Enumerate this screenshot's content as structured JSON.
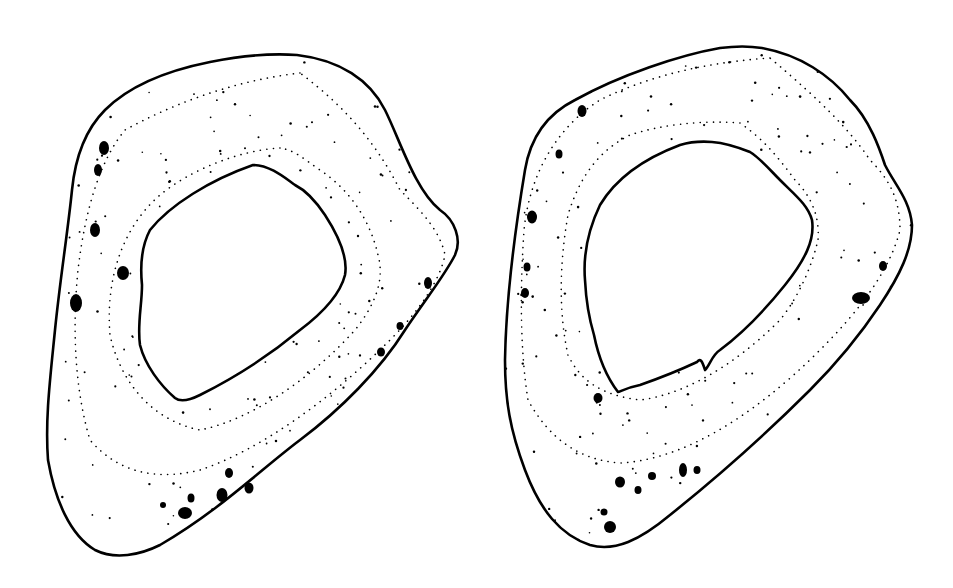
{
  "figure": {
    "background": "#ffffff",
    "ink_color": "#000000",
    "sections": [
      {
        "id": "left",
        "label": "bone-cross-section-left",
        "outer_path": "M297,55 C340,60 370,80 385,110 C400,140 415,190 440,210 C455,220 462,240 455,255 C445,275 425,300 405,330 C380,370 340,410 300,440 C260,470 220,510 160,545 C140,555 115,560 95,550 C70,535 55,500 48,460 C45,420 50,380 55,330 C60,280 68,230 72,190 C75,160 85,130 105,110 C130,85 170,70 210,62 C240,56 270,53 297,55 Z",
        "inner_path": "M253,165 C270,165 285,178 295,185 C305,190 315,200 325,215 C338,235 348,258 345,275 C340,295 320,315 300,330 C270,355 240,375 200,395 C190,400 180,402 175,398 C160,385 145,365 140,345 C137,325 142,305 142,285 C140,265 142,245 150,230 C170,205 210,180 253,165 Z",
        "ring_paths": [
          "M300,73 C240,80 180,100 125,130 C100,160 85,210 78,270 C72,330 75,390 90,440 C120,475 160,480 200,470 C260,450 330,400 390,340 C420,310 440,280 445,255 C440,230 420,210 400,190 C380,150 350,110 300,73 Z",
          "M280,148 C240,150 190,170 160,195 C125,225 105,275 110,335 C120,380 150,420 200,430 C250,420 310,380 355,330 C375,305 385,280 378,255 C370,220 350,190 320,170 C305,160 295,150 280,148 Z"
        ],
        "spots": [
          {
            "cx": 104,
            "cy": 148,
            "rx": 5,
            "ry": 7
          },
          {
            "cx": 98,
            "cy": 170,
            "rx": 4,
            "ry": 6
          },
          {
            "cx": 95,
            "cy": 230,
            "rx": 5,
            "ry": 7
          },
          {
            "cx": 123,
            "cy": 273,
            "rx": 6,
            "ry": 7
          },
          {
            "cx": 76,
            "cy": 303,
            "rx": 6,
            "ry": 9
          },
          {
            "cx": 428,
            "cy": 283,
            "rx": 4,
            "ry": 6
          },
          {
            "cx": 400,
            "cy": 326,
            "rx": 3.5,
            "ry": 4
          },
          {
            "cx": 381,
            "cy": 352,
            "rx": 4,
            "ry": 4.5
          },
          {
            "cx": 229,
            "cy": 473,
            "rx": 4,
            "ry": 5
          },
          {
            "cx": 249,
            "cy": 488,
            "rx": 4.5,
            "ry": 5.5
          },
          {
            "cx": 222,
            "cy": 495,
            "rx": 5.5,
            "ry": 7
          },
          {
            "cx": 191,
            "cy": 498,
            "rx": 3.5,
            "ry": 4.5
          },
          {
            "cx": 163,
            "cy": 505,
            "rx": 3,
            "ry": 3
          },
          {
            "cx": 185,
            "cy": 513,
            "rx": 7,
            "ry": 6
          }
        ]
      },
      {
        "id": "right",
        "label": "bone-cross-section-right",
        "outer_path": "M762,48 C800,55 830,75 850,100 C870,120 880,150 885,165 C895,185 910,200 912,225 C912,250 900,275 880,305 C860,335 840,360 810,390 C770,430 720,475 670,515 C640,540 615,552 590,545 C560,535 540,510 525,470 C510,430 505,400 505,360 C506,300 515,230 525,170 C530,140 545,115 575,100 C620,75 680,55 720,48 C735,46 750,46 762,48 Z",
        "inner_path": "M712,142 C725,143 740,148 750,152 C760,158 770,170 780,180 C795,195 808,205 812,220 C815,240 805,260 785,285 C765,310 740,335 720,350 C712,355 710,365 705,370 C702,360 700,358 697,362 C680,370 660,378 640,385 C625,388 620,392 618,392 C605,375 598,355 594,335 C588,315 586,300 585,280 C583,255 588,230 600,205 C615,180 640,160 680,145 C690,142 700,141 712,142 Z",
        "ring_paths": [
          "M770,58 C710,62 650,75 600,100 C560,125 530,170 524,230 C520,290 520,350 528,400 C550,440 580,460 620,463 C680,460 750,420 820,350 C860,310 890,270 900,230 C900,200 890,180 870,160 C850,130 820,100 770,58 Z",
          "M740,123 C700,120 660,125 630,135 C600,150 580,175 568,215 C560,260 558,310 568,355 C580,380 600,395 640,400 C680,395 730,370 780,320 C800,295 812,265 818,240 C820,215 810,195 795,180 C780,160 765,140 740,123 Z"
        ],
        "spots": [
          {
            "cx": 582,
            "cy": 111,
            "rx": 4.5,
            "ry": 6
          },
          {
            "cx": 559,
            "cy": 154,
            "rx": 3.5,
            "ry": 4.5
          },
          {
            "cx": 532,
            "cy": 217,
            "rx": 5,
            "ry": 6.5
          },
          {
            "cx": 527,
            "cy": 267,
            "rx": 3.5,
            "ry": 4.5
          },
          {
            "cx": 525,
            "cy": 293,
            "rx": 4,
            "ry": 5
          },
          {
            "cx": 883,
            "cy": 266,
            "rx": 4,
            "ry": 5
          },
          {
            "cx": 861,
            "cy": 298,
            "rx": 9,
            "ry": 6
          },
          {
            "cx": 598,
            "cy": 398,
            "rx": 4.5,
            "ry": 5
          },
          {
            "cx": 683,
            "cy": 470,
            "rx": 4,
            "ry": 7
          },
          {
            "cx": 697,
            "cy": 470,
            "rx": 3.5,
            "ry": 4
          },
          {
            "cx": 652,
            "cy": 476,
            "rx": 4,
            "ry": 4
          },
          {
            "cx": 620,
            "cy": 482,
            "rx": 5,
            "ry": 5.5
          },
          {
            "cx": 638,
            "cy": 490,
            "rx": 3.5,
            "ry": 4
          },
          {
            "cx": 604,
            "cy": 512,
            "rx": 3.5,
            "ry": 3.5
          },
          {
            "cx": 610,
            "cy": 527,
            "rx": 6,
            "ry": 6
          }
        ]
      }
    ]
  }
}
